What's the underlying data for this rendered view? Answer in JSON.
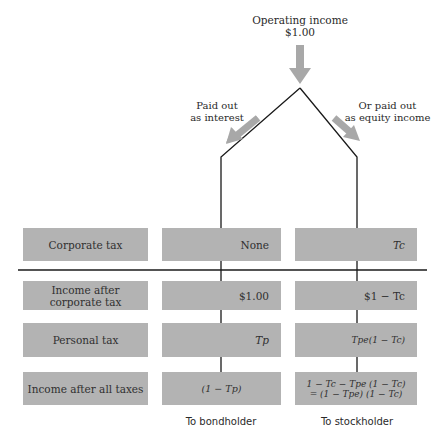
{
  "title": {
    "line1": "Operating income",
    "line2": "$1.00"
  },
  "branches": {
    "left_label_line1": "Paid out",
    "left_label_line2": "as interest",
    "right_label_line1": "Or paid out",
    "right_label_line2": "as equity income"
  },
  "rows": [
    {
      "label": "Corporate tax",
      "label_line2": "",
      "bond": "None",
      "stock": "Tc"
    },
    {
      "label": "Income after",
      "label_line2": "corporate tax",
      "bond": "$1.00",
      "stock": "$1 − Tc"
    },
    {
      "label": "Personal tax",
      "label_line2": "",
      "bond": "Tp",
      "stock": "Tpe(1 − Tc)"
    },
    {
      "label": "Income after all taxes",
      "label_line2": "",
      "bond": "(1 − Tp)",
      "stock_line1": "1 − Tc − Tpe (1 − Tc)",
      "stock_line2": "= (1 − Tpe) (1 − Tc)"
    }
  ],
  "footer": {
    "bond": "To bondholder",
    "stock": "To stockholder"
  },
  "colors": {
    "box_fill": "#b3b3b3",
    "arrow_fill": "#a8a8a8",
    "line": "#1a1a1a"
  }
}
